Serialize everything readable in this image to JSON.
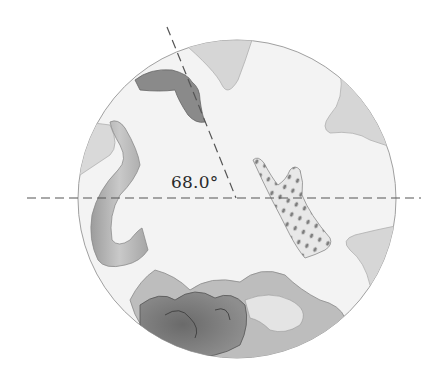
{
  "figure": {
    "angle_label": "68.0°",
    "angle_degrees": 68.0,
    "elements": {
      "drum": "circular dryer drum",
      "baffles": [
        "top baffle",
        "upper-right baffle",
        "lower-right baffle",
        "left baffle"
      ],
      "clothing": [
        "dark sock falling near top",
        "long towel/strip on left",
        "polka-dot garment on right",
        "pile of clothes at bottom"
      ],
      "reference_lines": [
        "horizontal dashed line through center",
        "dashed radial line at 68.0° above horizontal"
      ]
    },
    "colors": {
      "drum_fill": "#f2f2f2",
      "drum_outline": "#9a9a9a",
      "baffle_fill": "#d4d4d4",
      "dashed_line": "#555555",
      "cloth_dark": "#7a7a7a",
      "cloth_mid": "#a8a8a8",
      "cloth_light": "#e6e6e6"
    }
  }
}
